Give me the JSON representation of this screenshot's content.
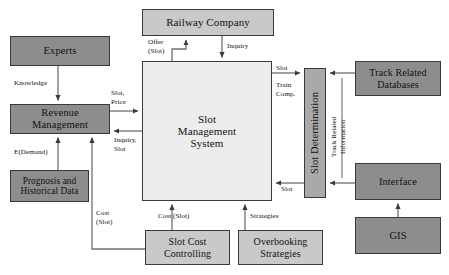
{
  "diagram": {
    "type": "block-flow-diagram",
    "canvas": {
      "width": 449,
      "height": 275,
      "background": "#ffffff"
    },
    "palette": {
      "dark_gray": "#8d8d8d",
      "mid_gray": "#a9a9a9",
      "light_gray": "#c9c9c9",
      "pale_gray": "#ededed",
      "border": "#3a3a3a",
      "line": "#555555",
      "text": "#111111"
    },
    "nodes": [
      {
        "id": "experts",
        "label": "Experts",
        "fill": "dark_gray",
        "x": 10,
        "y": 36,
        "w": 100,
        "h": 30,
        "font_size": 10.5,
        "vertical": false
      },
      {
        "id": "revenue_management",
        "label": "Revenue\nManagement",
        "fill": "dark_gray",
        "x": 10,
        "y": 104,
        "w": 100,
        "h": 30,
        "font_size": 10.5,
        "vertical": false
      },
      {
        "id": "prognosis",
        "label": "Prognosis and\nHistorical Data",
        "fill": "dark_gray",
        "x": 10,
        "y": 170,
        "w": 79,
        "h": 32,
        "font_size": 9.3,
        "vertical": false
      },
      {
        "id": "railway_company",
        "label": "Railway Company",
        "fill": "light_gray",
        "x": 142,
        "y": 9,
        "w": 132,
        "h": 27,
        "font_size": 11,
        "vertical": false
      },
      {
        "id": "slot_management_system",
        "label": "Slot\nManagement\nSystem",
        "fill": "pale_gray",
        "x": 142,
        "y": 61,
        "w": 130,
        "h": 140,
        "font_size": 11,
        "vertical": false
      },
      {
        "id": "slot_determination",
        "label": "Slot Determination",
        "fill": "mid_gray",
        "x": 304,
        "y": 68,
        "w": 22,
        "h": 130,
        "font_size": 10.5,
        "vertical": true
      },
      {
        "id": "track_related_databases",
        "label": "Track Related\nDatabases",
        "fill": "dark_gray",
        "x": 355,
        "y": 61,
        "w": 86,
        "h": 35,
        "font_size": 10,
        "vertical": false
      },
      {
        "id": "interface",
        "label": "Interface",
        "fill": "dark_gray",
        "x": 355,
        "y": 163,
        "w": 86,
        "h": 37,
        "font_size": 10.5,
        "vertical": false
      },
      {
        "id": "gis",
        "label": "GIS",
        "fill": "dark_gray",
        "x": 355,
        "y": 217,
        "w": 86,
        "h": 37,
        "font_size": 10.5,
        "vertical": false
      },
      {
        "id": "slot_cost_controlling",
        "label": "Slot Cost\nControlling",
        "fill": "light_gray",
        "x": 145,
        "y": 230,
        "w": 85,
        "h": 35,
        "font_size": 10,
        "vertical": false
      },
      {
        "id": "overbooking_strategies",
        "label": "Overbooking\nStrategies",
        "fill": "light_gray",
        "x": 238,
        "y": 230,
        "w": 85,
        "h": 35,
        "font_size": 10,
        "vertical": false
      }
    ],
    "edges": [
      {
        "id": "experts-to-revenue",
        "from": "experts",
        "to": "revenue_management",
        "label": "Knowledge",
        "label_x": 14,
        "label_y": 79
      },
      {
        "id": "prognosis-to-revenue",
        "from": "prognosis",
        "to": "revenue_management",
        "label": "E(Demand)",
        "label_x": 14,
        "label_y": 148
      },
      {
        "id": "sms-to-railway",
        "from": "slot_management_system",
        "to": "railway_company",
        "label": "Offer\n(Slot)",
        "label_x": 156,
        "label_y": 39
      },
      {
        "id": "railway-to-sms",
        "from": "railway_company",
        "to": "slot_management_system",
        "label": "Inquiry",
        "label_x": 228,
        "label_y": 43
      },
      {
        "id": "revenue-to-sms",
        "from": "revenue_management",
        "to": "slot_management_system",
        "label": "Slot,\nPrice",
        "label_x": 110,
        "label_y": 90
      },
      {
        "id": "sms-to-revenue",
        "from": "slot_management_system",
        "to": "revenue_management",
        "label": "Inquiry,\nSlot",
        "label_x": 112,
        "label_y": 135
      },
      {
        "id": "sms-to-slotdet",
        "from": "slot_management_system",
        "to": "slot_determination",
        "label": "Slot\n\nTrain\nComp.",
        "label_x": 276,
        "label_y": 63
      },
      {
        "id": "slotdet-to-sms",
        "from": "slot_determination",
        "to": "slot_management_system",
        "label": "Slot",
        "label_x": 281,
        "label_y": 185
      },
      {
        "id": "trackdb-to-slotdet",
        "from": "track_related_databases",
        "to": "slot_determination",
        "label": "",
        "label_x": 0,
        "label_y": 0
      },
      {
        "id": "interface-to-slotdet",
        "from": "interface",
        "to": "slot_determination",
        "label": "",
        "label_x": 0,
        "label_y": 0
      },
      {
        "id": "gis-to-interface",
        "from": "gis",
        "to": "interface",
        "label": "",
        "label_x": 0,
        "label_y": 0
      },
      {
        "id": "trackinfo-vertical",
        "from": "track_related_databases",
        "to": "interface",
        "label": "Track Related\nInformation",
        "label_x": 332,
        "label_y": 110
      },
      {
        "id": "slotcost-to-sms",
        "from": "slot_cost_controlling",
        "to": "slot_management_system",
        "label": "Cost (Slot)",
        "label_x": 156,
        "label_y": 212
      },
      {
        "id": "overbooking-to-sms",
        "from": "overbooking_strategies",
        "to": "slot_management_system",
        "label": "Strategies",
        "label_x": 247,
        "label_y": 212
      },
      {
        "id": "slotcost-to-revenue",
        "from": "slot_cost_controlling",
        "to": "revenue_management",
        "label": "Cost\n(Slot)",
        "label_x": 96,
        "label_y": 209
      }
    ]
  }
}
